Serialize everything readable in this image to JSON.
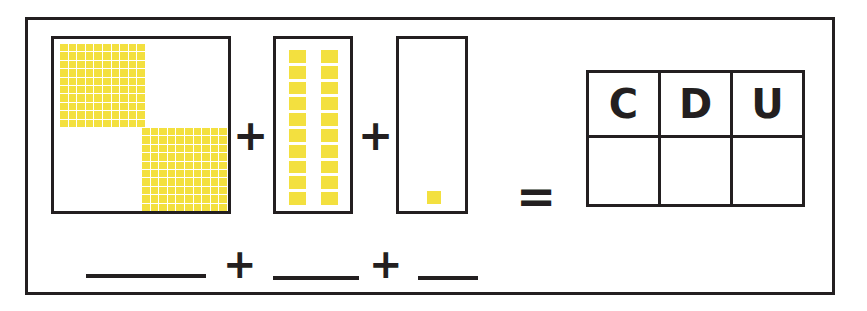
{
  "worksheet": {
    "title": "Place value blocks addition exercise",
    "accent_color": "#f3e03f",
    "ink_color": "#231f20",
    "background_color": "#ffffff"
  },
  "blocks": {
    "hundreds": {
      "label": "hundreds-flats",
      "flat_count": 2,
      "grid_rows": 10,
      "grid_cols": 10,
      "squares_per_flat": 100,
      "total_value": 200
    },
    "tens": {
      "label": "tens-rods",
      "rod_count": 2,
      "squares_per_rod": 10,
      "total_value": 20
    },
    "units": {
      "label": "unit-cubes",
      "cube_count": 1,
      "total_value": 1
    }
  },
  "operators": {
    "plus": "+",
    "equals": "="
  },
  "cdu_table": {
    "headers": [
      "C",
      "D",
      "U"
    ],
    "answers": [
      "",
      "",
      ""
    ]
  },
  "expression": {
    "blank_hundreds": "",
    "blank_tens": "",
    "blank_units": "",
    "plus_1": "+",
    "plus_2": "+"
  }
}
